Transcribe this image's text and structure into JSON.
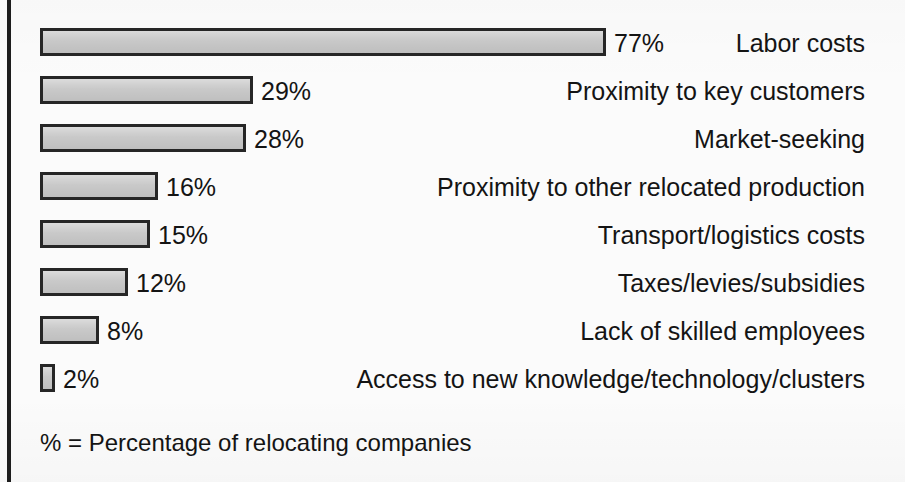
{
  "chart_data": {
    "type": "bar",
    "orientation": "horizontal",
    "title": "",
    "subtitle": "",
    "xlabel": "",
    "ylabel": "",
    "xlim": [
      0,
      77
    ],
    "grid": false,
    "legend": "none",
    "value_suffix": "%",
    "categories": [
      "Labor costs",
      "Proximity to key customers",
      "Market-seeking",
      "Proximity to other relocated production",
      "Transport/logistics costs",
      "Taxes/levies/subsidies",
      "Lack of skilled employees",
      "Access to new knowledge/technology/clusters"
    ],
    "values": [
      77,
      29,
      28,
      16,
      15,
      12,
      8,
      2
    ],
    "value_labels": [
      "77%",
      "29%",
      "28%",
      "16%",
      "15%",
      "12%",
      "8%",
      "2%"
    ],
    "annotation": "% = Percentage of relocating companies",
    "colors": {
      "bar_fill": "#c9c9c9",
      "bar_border": "#262626",
      "text": "#141414",
      "background": "#fbfbfb",
      "left_rule": "#1d1d1d"
    }
  },
  "footnote": {
    "text": "% = Percentage of relocating companies"
  }
}
